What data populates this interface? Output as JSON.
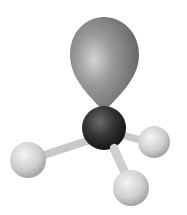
{
  "figure": {
    "central_atom": {
      "cx": 104,
      "cy": 128,
      "r": 22,
      "color": "#2e2e2e"
    },
    "lone_pair": {
      "color": "#8a8a8a"
    },
    "peripheral_atoms": [
      {
        "cx": 28,
        "cy": 160,
        "r": 18,
        "color": "#d6d6d6"
      },
      {
        "cx": 154,
        "cy": 142,
        "r": 16,
        "color": "#d6d6d6"
      },
      {
        "cx": 131,
        "cy": 188,
        "r": 18,
        "color": "#d6d6d6"
      }
    ],
    "bond_color": "#cfcfcf"
  }
}
